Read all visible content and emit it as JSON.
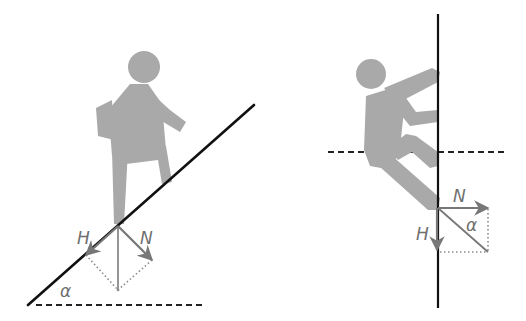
{
  "colors": {
    "background": "#ffffff",
    "figure": "#a9a9a9",
    "surface_line": "#111111",
    "force_vector": "#777777",
    "dotted": "#8a8a8a",
    "label": "#6f6f6f"
  },
  "left_panel": {
    "scene": "Person walking up an inclined slope",
    "labels": {
      "h": "H",
      "n": "N",
      "alpha": "α"
    }
  },
  "right_panel": {
    "scene": "Person climbing a vertical wall",
    "labels": {
      "h": "H",
      "n": "N",
      "alpha": "α"
    }
  }
}
